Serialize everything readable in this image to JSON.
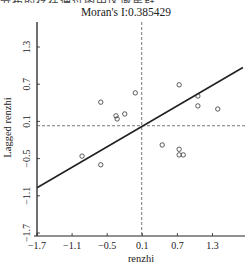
{
  "header": {
    "cropped_text": "分布的存在通过图中区域集群，"
  },
  "chart_data": {
    "type": "scatter",
    "title": "Moran's I:0.385429",
    "xlabel": "renzhi",
    "ylabel": "Lagged renzhi",
    "xlim": [
      -1.7,
      1.7
    ],
    "ylim": [
      -1.7,
      1.9
    ],
    "x_ticks": [
      "-1.7",
      "-1.1",
      "-0.5",
      "0.1",
      "0.7",
      "1.3"
    ],
    "y_ticks": [
      "-1.7",
      "-1.1",
      "-0.5",
      "0.1",
      "0.7",
      "1.3"
    ],
    "grid": false,
    "legend": null,
    "mean_lines": {
      "x": 0.09,
      "y": 0.03,
      "style": "dashed"
    },
    "regression_line": {
      "slope": 0.385429,
      "from": [
        -1.7,
        -0.97
      ],
      "to": [
        1.82,
        0.97
      ]
    },
    "points": [
      {
        "x": -0.61,
        "y": 0.41
      },
      {
        "x": -0.35,
        "y": 0.19
      },
      {
        "x": -0.33,
        "y": 0.14
      },
      {
        "x": -0.2,
        "y": 0.22
      },
      {
        "x": -0.02,
        "y": 0.56
      },
      {
        "x": -0.93,
        "y": -0.46
      },
      {
        "x": -0.61,
        "y": -0.6
      },
      {
        "x": 0.73,
        "y": 0.69
      },
      {
        "x": 1.05,
        "y": 0.51
      },
      {
        "x": 1.05,
        "y": 0.35
      },
      {
        "x": 1.39,
        "y": 0.3
      },
      {
        "x": 0.44,
        "y": -0.28
      },
      {
        "x": 0.73,
        "y": -0.35
      },
      {
        "x": 0.73,
        "y": -0.44
      },
      {
        "x": 0.8,
        "y": -0.44
      }
    ]
  },
  "colors": {
    "axis": "#222222",
    "line": "#222222",
    "points": "#333333",
    "dashed": "#555555"
  }
}
